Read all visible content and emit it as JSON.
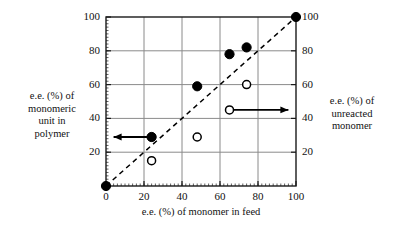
{
  "chart_data": {
    "type": "scatter",
    "title": "",
    "xlabel": "e.e. (%) of monomer in feed",
    "ylabel_left": "e.e. (%) of\nmonomeric\nunit in\npolymer",
    "ylabel_right": "e.e. (%) of\nunreacted\nmonomer",
    "xlim": [
      0,
      100
    ],
    "ylim": [
      0,
      100
    ],
    "xticks": [
      0,
      20,
      40,
      60,
      80,
      100
    ],
    "yticks_left": [
      20,
      40,
      60,
      80,
      100
    ],
    "yticks_right": [
      20,
      40,
      60,
      80,
      100
    ],
    "grid": true,
    "legend_position": "inside-plot-arrows",
    "series": [
      {
        "name": "e.e. (%) of monomeric unit in polymer",
        "marker": "filled-circle",
        "axis": "left",
        "color": "#000000",
        "points": [
          {
            "x": 0,
            "y": 0
          },
          {
            "x": 24,
            "y": 29
          },
          {
            "x": 48,
            "y": 59
          },
          {
            "x": 65,
            "y": 78
          },
          {
            "x": 74,
            "y": 82
          },
          {
            "x": 100,
            "y": 100
          }
        ]
      },
      {
        "name": "e.e. (%) of unreacted monomer",
        "marker": "open-circle",
        "axis": "right",
        "color": "#000000",
        "points": [
          {
            "x": 24,
            "y": 15
          },
          {
            "x": 48,
            "y": 29
          },
          {
            "x": 74,
            "y": 60
          }
        ]
      }
    ],
    "reference_line": {
      "name": "diagonal-parity-line",
      "style": "dashed",
      "from": {
        "x": 0,
        "y": 0
      },
      "to": {
        "x": 100,
        "y": 100
      }
    },
    "annotations": [
      {
        "name": "left-axis-arrow",
        "marker": "filled-circle",
        "direction": "left",
        "at": {
          "x": 24,
          "y": 29
        },
        "to": {
          "x": 4,
          "y": 29
        }
      },
      {
        "name": "right-axis-arrow",
        "marker": "open-circle",
        "direction": "right",
        "at": {
          "x": 65,
          "y": 45
        },
        "to": {
          "x": 96,
          "y": 45
        }
      }
    ]
  },
  "axes": {
    "x_label": "e.e. (%) of monomer in feed",
    "left_label": "e.e. (%) of\nmonomeric\nunit in\npolymer",
    "right_label": "e.e. (%) of\nunreacted\nmonomer",
    "x_ticks": [
      "0",
      "20",
      "40",
      "60",
      "80",
      "100"
    ],
    "y_ticks_left": [
      "20",
      "40",
      "60",
      "80",
      "100"
    ],
    "y_ticks_right": [
      "20",
      "40",
      "60",
      "80",
      "100"
    ]
  },
  "colors": {
    "axis": "#1a1a1a",
    "grid": "#8a8a8a",
    "marker": "#000000",
    "background": "#ffffff"
  }
}
